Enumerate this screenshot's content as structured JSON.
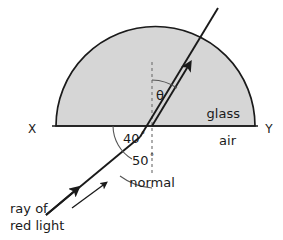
{
  "diagram": {
    "colors": {
      "glass_fill": "#d6d6d6",
      "outline": "#1a1a1a",
      "ray": "#1a1a1a",
      "arc": "#555555",
      "normal_dash": "#777777",
      "background": "#ffffff",
      "text": "#1a1a1a"
    },
    "labels": {
      "x_point": "X",
      "y_point": "Y",
      "glass": "glass",
      "air": "air",
      "angle_refraction": "θ",
      "angle_40": "40",
      "angle_40_degree": "°",
      "angle_50": "50",
      "angle_50_degree": "°",
      "normal": "normal",
      "ray_line1": "ray of",
      "ray_line2": "red light"
    },
    "values": {
      "angle_below_surface_deg": 40,
      "angle_of_incidence_deg": 50,
      "angle_of_refraction_symbol": "θ"
    },
    "icons": {
      "ray_arrow_incident": "arrow-up-right-icon",
      "ray_arrow_refracted": "arrow-up-right-icon",
      "pointer_arrow": "arrow-up-right-icon"
    }
  }
}
